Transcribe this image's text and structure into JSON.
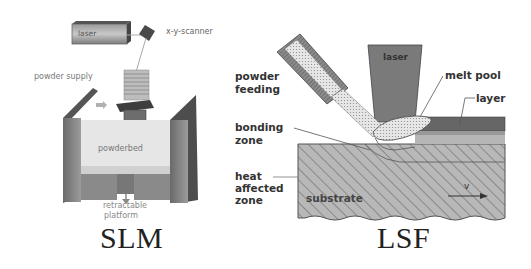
{
  "figure": {
    "panels": [
      {
        "id": "slm",
        "caption": "SLM",
        "labels": {
          "laser": "laser",
          "scanner": "x-y-scanner",
          "powder_supply": "powder supply",
          "powderbed": "powderbed",
          "platform_line1": "retractable",
          "platform_line2": "platform"
        }
      },
      {
        "id": "lsf",
        "caption": "LSF",
        "labels": {
          "laser": "laser",
          "powder_feeding_line1": "powder",
          "powder_feeding_line2": "feeding",
          "melt_pool": "melt pool",
          "layer": "layer",
          "bonding_zone_line1": "bonding",
          "bonding_zone_line2": "zone",
          "haz_line1": "heat",
          "haz_line2": "affected",
          "haz_line3": "zone",
          "substrate": "substrate",
          "velocity": "v"
        }
      }
    ],
    "colors": {
      "background": "#ffffff",
      "dark_gray": "#5a5a5a",
      "mid_gray": "#8c8c8c",
      "light_gray": "#d4d4d4",
      "hatch": "#b9b9b9",
      "text": "#333333"
    }
  }
}
